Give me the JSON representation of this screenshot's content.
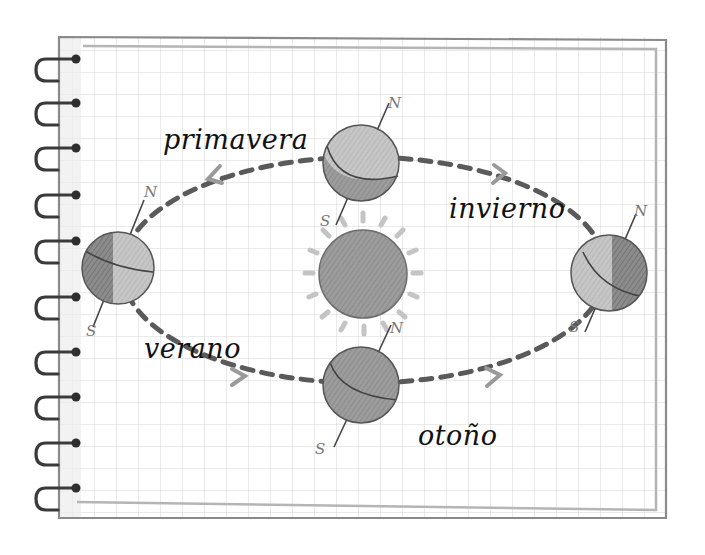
{
  "diagram": {
    "type": "orbit-of-earth-around-sun",
    "style": "hand-drawn pencil on spiral notebook grid paper",
    "colors": {
      "paper": "#ffffff",
      "grid": "#d6d6d6",
      "notebook_border": "#8a8a8a",
      "inner_border": "#b5b5b5",
      "orbit_dash": "#5a5a5a",
      "arrow": "#9a9a9a",
      "sun": "#a9a9a9",
      "sun_rays": "#c4c4c4",
      "planet_light": "#bdbdbd",
      "planet_dark": "#7a7a7a",
      "spiral": "#3a3a3a",
      "text": "#111111"
    },
    "sun": {
      "label": ""
    },
    "seasons": [
      {
        "id": "primavera",
        "label": "primavera",
        "position": "top"
      },
      {
        "id": "invierno",
        "label": "invierno",
        "position": "right"
      },
      {
        "id": "otono",
        "label": "otoño",
        "position": "bottom"
      },
      {
        "id": "verano",
        "label": "verano",
        "position": "left"
      }
    ],
    "poles": {
      "north": "N",
      "south": "S"
    },
    "spiral_rings": 10
  }
}
